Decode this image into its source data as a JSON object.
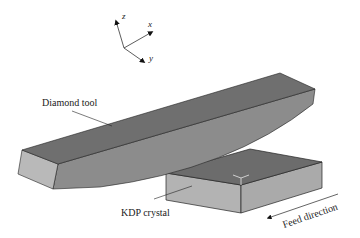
{
  "figure": {
    "axes": {
      "z_label": "z",
      "x_label": "x",
      "y_label": "y"
    },
    "labels": {
      "tool": "Diamond tool",
      "crystal": "KDP crystal",
      "feed": "Feed direction"
    },
    "colors": {
      "tool_top": "#6f6f6f",
      "tool_front": "#8c8c8c",
      "tool_end": "#b9b9b9",
      "crystal_top": "#6c6c6c",
      "crystal_side": "#b3b3b3",
      "edge": "#222222"
    }
  }
}
